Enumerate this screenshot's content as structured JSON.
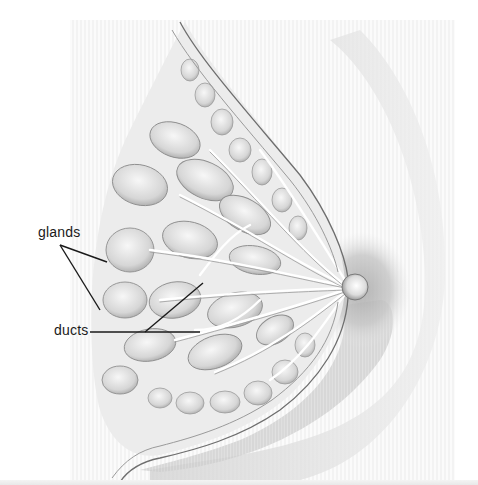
{
  "figure": {
    "style": "grayscale pencil illustration",
    "colors": {
      "background": "#ffffff",
      "hatching": "#e9e9e9",
      "tissue_light": "#f2f2f2",
      "tissue_mid": "#cfcfcf",
      "tissue_dark": "#8a8a8a",
      "outline": "#6e6e6e",
      "label_text": "#1a1a1a",
      "leader_line": "#1a1a1a"
    },
    "labels": [
      {
        "id": "glands",
        "text": "glands",
        "x": 38,
        "y": 226,
        "leaders": [
          [
            60,
            245,
            107,
            262
          ],
          [
            60,
            245,
            100,
            310
          ]
        ]
      },
      {
        "id": "ducts",
        "text": "ducts",
        "x": 54,
        "y": 324,
        "leaders": [
          [
            90,
            332,
            200,
            332
          ],
          [
            145,
            332,
            203,
            283
          ]
        ]
      }
    ],
    "nipple": {
      "cx": 355,
      "cy": 287,
      "r": 13
    }
  }
}
